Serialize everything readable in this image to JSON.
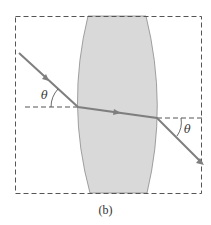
{
  "figure": {
    "caption": "(b)",
    "angle_label_left": "θ",
    "angle_label_right": "θ",
    "colors": {
      "lens_fill": "#d9d9d9",
      "lens_edge": "#8a8a8a",
      "ray": "#7f7f7f",
      "dashed": "#555555",
      "text": "#333333"
    }
  }
}
